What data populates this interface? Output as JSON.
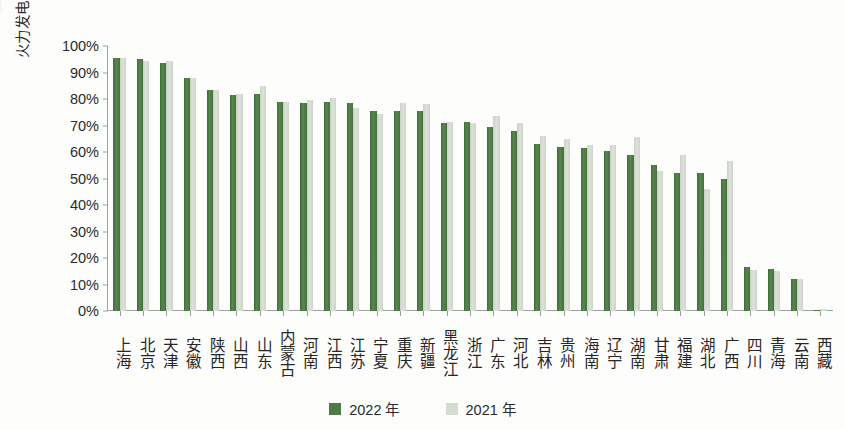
{
  "chart_data": {
    "type": "bar",
    "title": "",
    "subtitle": "",
    "xlabel": "",
    "ylabel": "火力发电量占本地总发电量的比重",
    "ylim": [
      0,
      100
    ],
    "yticks": [
      "0%",
      "10%",
      "20%",
      "30%",
      "40%",
      "50%",
      "60%",
      "70%",
      "80%",
      "90%",
      "100%"
    ],
    "ytick_values": [
      0,
      10,
      20,
      30,
      40,
      50,
      60,
      70,
      80,
      90,
      100
    ],
    "grid": false,
    "legend_position": "bottom-center",
    "unit": "%",
    "categories": [
      "上海",
      "北京",
      "天津",
      "安徽",
      "陕西",
      "山西",
      "山东",
      "内蒙古",
      "河南",
      "江西",
      "江苏",
      "宁夏",
      "重庆",
      "新疆",
      "黑龙江",
      "浙江",
      "广东",
      "河北",
      "吉林",
      "贵州",
      "海南",
      "辽宁",
      "湖南",
      "甘肃",
      "福建",
      "湖北",
      "广西",
      "四川",
      "青海",
      "云南",
      "西藏"
    ],
    "series": [
      {
        "name": "2022 年",
        "color": "#4d7a45",
        "values": [
          95.5,
          95.0,
          93.5,
          88.0,
          83.5,
          81.5,
          82.0,
          79.0,
          78.5,
          79.0,
          78.5,
          75.5,
          75.5,
          75.5,
          71.0,
          71.5,
          69.5,
          68.0,
          63.0,
          62.0,
          61.5,
          60.5,
          59.0,
          55.0,
          52.0,
          52.0,
          50.0,
          16.5,
          16.0,
          12.0,
          0.5
        ]
      },
      {
        "name": "2021 年",
        "color": "#d4dbd1",
        "values": [
          95.5,
          94.5,
          94.5,
          88.0,
          83.5,
          82.0,
          85.0,
          79.0,
          79.5,
          80.5,
          76.5,
          74.5,
          78.5,
          78.0,
          71.5,
          71.0,
          73.5,
          71.0,
          66.0,
          65.0,
          62.5,
          62.5,
          65.5,
          53.0,
          59.0,
          46.0,
          56.5,
          15.5,
          15.0,
          12.0,
          0.8
        ]
      }
    ]
  },
  "legend": {
    "items": [
      {
        "label": "2022 年",
        "color": "#4d7a45"
      },
      {
        "label": "2021 年",
        "color": "#d4dbd1"
      }
    ]
  }
}
